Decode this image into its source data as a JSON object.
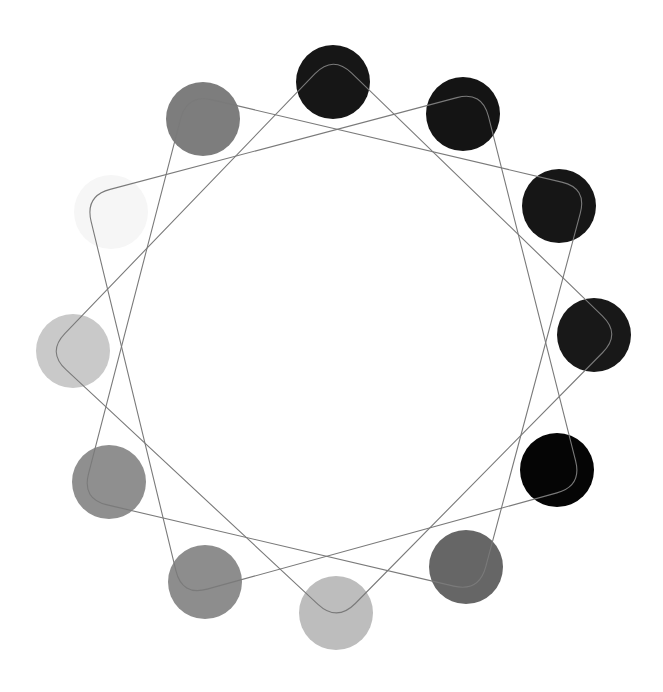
{
  "canvas": {
    "width": 663,
    "height": 692,
    "background": "#ffffff"
  },
  "figure": {
    "center": [
      334,
      347
    ],
    "circle_radius": 37,
    "line_color": "#7a7a7a",
    "line_width": 1.1,
    "circles": [
      {
        "id": 0,
        "cx": 333,
        "cy": 82,
        "fill": "#161616"
      },
      {
        "id": 1,
        "cx": 463,
        "cy": 114,
        "fill": "#141414"
      },
      {
        "id": 2,
        "cx": 559,
        "cy": 206,
        "fill": "#161616"
      },
      {
        "id": 3,
        "cx": 594,
        "cy": 335,
        "fill": "#181818"
      },
      {
        "id": 4,
        "cx": 557,
        "cy": 470,
        "fill": "#050505"
      },
      {
        "id": 5,
        "cx": 466,
        "cy": 567,
        "fill": "#666666"
      },
      {
        "id": 6,
        "cx": 336,
        "cy": 613,
        "fill": "#bdbdbd"
      },
      {
        "id": 7,
        "cx": 205,
        "cy": 582,
        "fill": "#8d8d8d"
      },
      {
        "id": 8,
        "cx": 109,
        "cy": 482,
        "fill": "#8f8f8f"
      },
      {
        "id": 9,
        "cx": 73,
        "cy": 351,
        "fill": "#c9c9c9"
      },
      {
        "id": 10,
        "cx": 111,
        "cy": 212,
        "fill": "#f6f6f6"
      },
      {
        "id": 11,
        "cx": 203,
        "cy": 119,
        "fill": "#7d7d7d"
      }
    ],
    "loops": [
      {
        "name": "loop-a",
        "corners": [
          [
            333,
            55
          ],
          [
            621,
            334
          ],
          [
            337,
            622
          ],
          [
            47,
            352
          ]
        ]
      },
      {
        "name": "loop-b",
        "corners": [
          [
            482,
            91
          ],
          [
            582,
            486
          ],
          [
            182,
            596
          ],
          [
            85,
            196
          ]
        ]
      },
      {
        "name": "loop-c",
        "corners": [
          [
            587,
            188
          ],
          [
            479,
            592
          ],
          [
            82,
            499
          ],
          [
            187,
            94
          ]
        ]
      }
    ],
    "corner_rounding": 26
  }
}
